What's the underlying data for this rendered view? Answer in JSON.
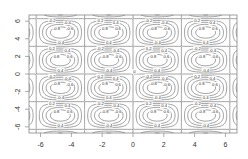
{
  "chart_data": {
    "type": "contour",
    "title": "",
    "xlabel": "",
    "ylabel": "",
    "function": "z = sin(x) * sin(y)",
    "xlim": [
      -6.75,
      6.75
    ],
    "ylim": [
      -6.7,
      6.7
    ],
    "x_ticks": [
      -6,
      -4,
      -2,
      0,
      2,
      4,
      6
    ],
    "y_ticks": [
      -6,
      -4,
      -2,
      0,
      2,
      4,
      6
    ],
    "x_tick_labels": [
      "-6",
      "-4",
      "-2",
      "0",
      "2",
      "4",
      "6"
    ],
    "y_tick_labels": [
      "-6",
      "-4",
      "-2",
      "0",
      "2",
      "4",
      "6"
    ],
    "contour_levels": [
      -0.8,
      -0.6,
      -0.4,
      -0.2,
      0,
      0.2,
      0.4,
      0.6,
      0.8
    ],
    "grid_cells": {
      "columns": [
        "-2π..-π",
        "-π..0",
        "0..π",
        "π..2π"
      ],
      "rows": [
        "π..2π",
        "0..π",
        "-π..0",
        "-2π..-π"
      ],
      "sign_pattern": [
        [
          "-",
          "+",
          "-",
          "+"
        ],
        [
          "+",
          "-",
          "+",
          "-"
        ],
        [
          "-",
          "+",
          "-",
          "+"
        ],
        [
          "+",
          "-",
          "+",
          "-"
        ]
      ]
    },
    "grid": false,
    "legend": null,
    "line_color": "#444444",
    "axis_color": "#888888",
    "background": "#ffffff"
  }
}
